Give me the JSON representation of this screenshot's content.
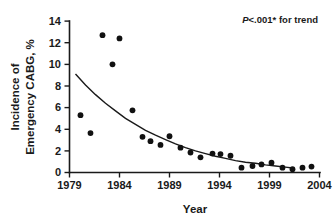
{
  "chart_data": {
    "type": "scatter",
    "title": "",
    "xlabel": "Year",
    "ylabel": "Incidence of Emergency CABG, %",
    "ylabel_lines": [
      "Incidence of",
      "Emergency CABG, %"
    ],
    "xlim": [
      1979,
      2004
    ],
    "ylim": [
      0,
      14
    ],
    "xticks": [
      1979,
      1984,
      1989,
      1994,
      1999,
      2004
    ],
    "xtick_labels": [
      "1979",
      "1984",
      "1989",
      "1994",
      "1999",
      "2004"
    ],
    "yticks": [
      0,
      2,
      4,
      6,
      8,
      10,
      12,
      14
    ],
    "ytick_labels": [
      "0",
      "2",
      "4",
      "6",
      "8",
      "10",
      "12",
      "14"
    ],
    "grid": false,
    "legend": false,
    "marker": "filled-circle",
    "x": [
      1980.1,
      1981.1,
      1982.3,
      1983.3,
      1984.0,
      1985.3,
      1986.3,
      1987.1,
      1988.1,
      1989.0,
      1990.1,
      1991.1,
      1992.1,
      1993.3,
      1994.1,
      1995.1,
      1996.2,
      1997.3,
      1998.2,
      1999.2,
      2000.3,
      2001.3,
      2002.3,
      2003.2
    ],
    "values": [
      5.3,
      3.65,
      12.7,
      10.0,
      12.4,
      5.75,
      3.3,
      2.9,
      2.55,
      3.35,
      2.3,
      1.85,
      1.4,
      1.75,
      1.7,
      1.55,
      0.45,
      0.6,
      0.75,
      0.9,
      0.45,
      0.3,
      0.45,
      0.55
    ],
    "series": [
      {
        "name": "Incidence of Emergency CABG",
        "x": [
          1980.1,
          1981.1,
          1982.3,
          1983.3,
          1984.0,
          1985.3,
          1986.3,
          1987.1,
          1988.1,
          1989.0,
          1990.1,
          1991.1,
          1992.1,
          1993.3,
          1994.1,
          1995.1,
          1996.2,
          1997.3,
          1998.2,
          1999.2,
          2000.3,
          2001.3,
          2002.3,
          2003.2
        ],
        "values": [
          5.3,
          3.65,
          12.7,
          10.0,
          12.4,
          5.75,
          3.3,
          2.9,
          2.55,
          3.35,
          2.3,
          1.85,
          1.4,
          1.75,
          1.7,
          1.55,
          0.45,
          0.6,
          0.75,
          0.9,
          0.45,
          0.3,
          0.45,
          0.55
        ]
      }
    ],
    "trend_curve": {
      "name": "fitted exponential decay trend",
      "x": [
        1979.6,
        1980.6,
        1981.6,
        1982.6,
        1983.6,
        1984.6,
        1985.6,
        1986.6,
        1987.6,
        1988.6,
        1989.6,
        1990.6,
        1991.6,
        1992.6,
        1993.6,
        1994.6,
        1995.6,
        1996.6,
        1997.6,
        1998.6,
        1999.6,
        2000.6,
        2001.3
      ],
      "values": [
        9.1,
        8.1,
        7.2,
        6.4,
        5.7,
        5.0,
        4.45,
        3.9,
        3.45,
        3.05,
        2.65,
        2.3,
        2.0,
        1.75,
        1.5,
        1.3,
        1.1,
        0.95,
        0.85,
        0.7,
        0.6,
        0.5,
        0.42
      ]
    },
    "annotations": [
      {
        "name": "p-value-trend",
        "italic_prefix": "P",
        "text": "<.001* for trend",
        "full_text": "P<.001* for trend",
        "x": 2000.0,
        "y": 13.4
      }
    ]
  }
}
